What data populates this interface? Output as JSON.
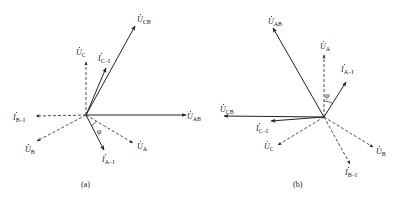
{
  "colors": {
    "line": "#222222",
    "background": "#ffffff"
  },
  "diagram_a": {
    "caption": "(a)",
    "angle_label": "φ",
    "origin": [
      86,
      115
    ],
    "phasors": [
      {
        "id": "U_CB",
        "base": "U",
        "sub": "CB",
        "dot": true,
        "style": "solid",
        "end": [
          135,
          26
        ],
        "label_pos": [
          137,
          22
        ]
      },
      {
        "id": "U_C",
        "base": "U",
        "sub": "C",
        "dot": true,
        "style": "dashed",
        "end": [
          86,
          62
        ],
        "label_pos": [
          76,
          55
        ]
      },
      {
        "id": "I_C-I",
        "base": "I",
        "sub": "C−I",
        "dot": true,
        "style": "solid",
        "end": [
          106,
          68
        ],
        "label_pos": [
          98,
          61
        ]
      },
      {
        "id": "I_B-I",
        "base": "I",
        "sub": "B−I",
        "dot": true,
        "style": "dashed",
        "end": [
          36,
          116
        ],
        "label_pos": [
          13,
          120
        ]
      },
      {
        "id": "U_B",
        "base": "U",
        "sub": "B",
        "dot": true,
        "style": "dashed",
        "end": [
          37,
          141
        ],
        "label_pos": [
          25,
          152
        ]
      },
      {
        "id": "U_AB",
        "base": "U",
        "sub": "AB",
        "dot": true,
        "style": "solid",
        "end": [
          186,
          115
        ],
        "label_pos": [
          187,
          119
        ]
      },
      {
        "id": "U_A",
        "base": "U",
        "sub": "A",
        "dot": true,
        "style": "dashed",
        "end": [
          133,
          143
        ],
        "label_pos": [
          137,
          149
        ]
      },
      {
        "id": "I_A-I",
        "base": "I",
        "sub": "A−I",
        "dot": true,
        "style": "solid",
        "end": [
          104,
          150
        ],
        "label_pos": [
          102,
          162
        ]
      }
    ]
  },
  "diagram_b": {
    "caption": "(b)",
    "angle_label": "φ",
    "origin": [
      324,
      117
    ],
    "phasors": [
      {
        "id": "U_AB",
        "base": "U",
        "sub": "AB",
        "dot": true,
        "style": "solid",
        "end": [
          273,
          28
        ],
        "label_pos": [
          268,
          24
        ]
      },
      {
        "id": "U_A",
        "base": "U",
        "sub": "A",
        "dot": true,
        "style": "dashed",
        "end": [
          324,
          55
        ],
        "label_pos": [
          320,
          49
        ]
      },
      {
        "id": "I_A-I",
        "base": "I",
        "sub": "A−I",
        "dot": true,
        "style": "solid",
        "end": [
          346,
          82
        ],
        "label_pos": [
          341,
          72
        ]
      },
      {
        "id": "U_CB",
        "base": "U",
        "sub": "CB",
        "dot": true,
        "style": "solid",
        "end": [
          224,
          116
        ],
        "label_pos": [
          220,
          112
        ]
      },
      {
        "id": "I_C-I",
        "base": "I",
        "sub": "C−I",
        "dot": true,
        "style": "solid",
        "end": [
          271,
          121
        ],
        "label_pos": [
          256,
          131
        ]
      },
      {
        "id": "U_C",
        "base": "U",
        "sub": "C",
        "dot": true,
        "style": "dashed",
        "end": [
          278,
          145
        ],
        "label_pos": [
          264,
          149
        ]
      },
      {
        "id": "U_B",
        "base": "U",
        "sub": "B",
        "dot": true,
        "style": "dashed",
        "end": [
          373,
          147
        ],
        "label_pos": [
          376,
          154
        ]
      },
      {
        "id": "I_B-I",
        "base": "I",
        "sub": "B−I",
        "dot": true,
        "style": "dashed",
        "end": [
          350,
          164
        ],
        "label_pos": [
          345,
          175
        ]
      }
    ]
  }
}
